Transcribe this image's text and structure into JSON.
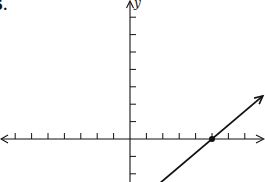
{
  "problem": {
    "number": "5."
  },
  "chart_data": {
    "type": "line",
    "title": "",
    "xlabel": "",
    "ylabel": "y",
    "xlim": [
      -7.9,
      8.1
    ],
    "ylim": [
      -2.5,
      8
    ],
    "x_ticks": [
      -7,
      -6,
      -5,
      -4,
      -3,
      -2,
      -1,
      1,
      2,
      3,
      4,
      5,
      6,
      7
    ],
    "y_ticks": [
      -2,
      -1,
      1,
      2,
      3,
      4,
      5,
      6,
      7
    ],
    "tick_labels_shown": false,
    "grid": false,
    "series": [
      {
        "name": "line",
        "equation": "y = (4/5)x - 4",
        "slope": 0.8,
        "intercept": -4,
        "x": [
          1.77,
          8.1
        ],
        "y": [
          -2.58,
          2.48
        ],
        "arrow_end": true,
        "color": "#111111"
      }
    ],
    "points": [
      {
        "label": "x-intercept",
        "x": 5,
        "y": 0
      }
    ],
    "annotations": [
      "y"
    ]
  },
  "style": {
    "ink": "#111111",
    "background": "#ffffff"
  }
}
